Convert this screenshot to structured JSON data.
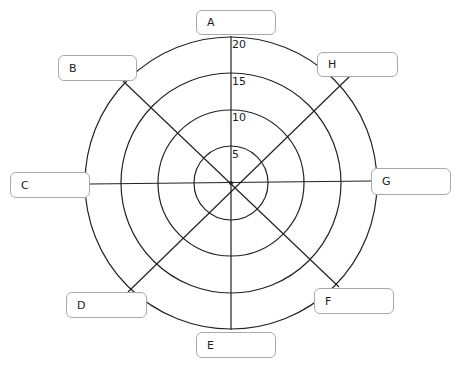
{
  "diagram": {
    "type": "radar-wheel-template",
    "center": [
      231,
      183
    ],
    "rings": [
      {
        "value": 5,
        "radius": 37
      },
      {
        "value": 10,
        "radius": 73
      },
      {
        "value": 15,
        "radius": 110
      },
      {
        "value": 20,
        "radius": 146
      }
    ],
    "scale_labels": [
      "5",
      "10",
      "15",
      "20"
    ],
    "spokes": [
      {
        "label": "A",
        "box": [
          196,
          10,
          80,
          25
        ]
      },
      {
        "label": "B",
        "box": [
          58,
          55,
          79,
          26
        ]
      },
      {
        "label": "C",
        "box": [
          10,
          172,
          80,
          26
        ]
      },
      {
        "label": "D",
        "box": [
          66,
          292,
          81,
          26
        ]
      },
      {
        "label": "E",
        "box": [
          196,
          332,
          80,
          26
        ]
      },
      {
        "label": "F",
        "box": [
          314,
          288,
          80,
          26
        ]
      },
      {
        "label": "G",
        "box": [
          371,
          168,
          80,
          27
        ]
      },
      {
        "label": "H",
        "box": [
          317,
          52,
          81,
          25
        ]
      }
    ],
    "line_color": "#222222",
    "box_border_color": "#aaaaaa"
  }
}
